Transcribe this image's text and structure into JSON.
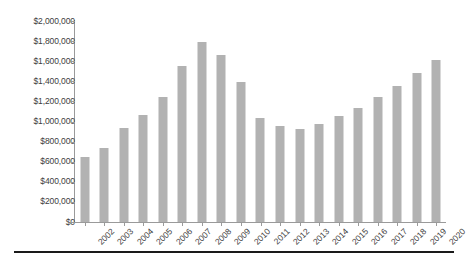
{
  "chart_data": {
    "type": "bar",
    "title": "",
    "subtitle": "",
    "xlabel": "",
    "ylabel": "",
    "grid": false,
    "legend": null,
    "ylim": [
      0,
      2000000
    ],
    "ytick_step": 200000,
    "ytick_labels": [
      "$2,000,000",
      "$1,800,000",
      "$1,600,000",
      "$1,400,000",
      "$1,200,000",
      "$1,000,000",
      "$800,000",
      "$600,000",
      "$400,000",
      "$200,000",
      "$0"
    ],
    "ytick_values": [
      2000000,
      1800000,
      1600000,
      1400000,
      1200000,
      1000000,
      800000,
      600000,
      400000,
      200000,
      0
    ],
    "categories": [
      "2002",
      "2003",
      "2004",
      "2005",
      "2006",
      "2007",
      "2008",
      "2009",
      "2010",
      "2011",
      "2012",
      "2013",
      "2014",
      "2015",
      "2016",
      "2017",
      "2018",
      "2019",
      "2020"
    ],
    "values": [
      647000,
      735000,
      940000,
      1065000,
      1245000,
      1555000,
      1790000,
      1660000,
      1390000,
      1035000,
      960000,
      925000,
      980000,
      1050000,
      1130000,
      1240000,
      1350000,
      1480000,
      1610000
    ],
    "series_name": "",
    "bar_color": "#b2b2b2",
    "axis_color": "#9a9a9a",
    "text_color": "#3d3d3d"
  }
}
